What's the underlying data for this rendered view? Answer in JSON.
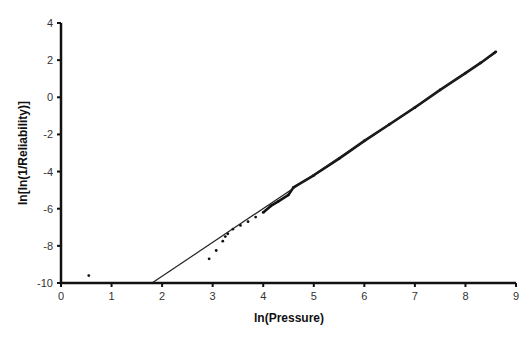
{
  "chart_data": {
    "type": "scatter",
    "title": "",
    "xlabel": "ln(Pressure)",
    "ylabel": "ln[ln(1/Reliability)]",
    "xlim": [
      0,
      9
    ],
    "ylim": [
      -10,
      4
    ],
    "xticks": [
      0,
      1,
      2,
      3,
      4,
      5,
      6,
      7,
      8,
      9
    ],
    "yticks": [
      4,
      2,
      0,
      -2,
      -4,
      -6,
      -8,
      -10
    ],
    "grid": false,
    "legend": null,
    "series": [
      {
        "name": "data points",
        "kind": "scatter",
        "points": [
          [
            0.55,
            -9.6
          ],
          [
            2.93,
            -8.7
          ],
          [
            3.07,
            -8.25
          ],
          [
            3.2,
            -7.75
          ],
          [
            3.25,
            -7.5
          ],
          [
            3.3,
            -7.35
          ],
          [
            3.4,
            -7.1
          ],
          [
            3.55,
            -6.9
          ],
          [
            3.7,
            -6.7
          ],
          [
            3.85,
            -6.45
          ],
          [
            4.0,
            -6.2
          ],
          [
            4.15,
            -5.85
          ],
          [
            4.3,
            -5.6
          ],
          [
            4.5,
            -5.25
          ],
          [
            4.6,
            -4.85
          ],
          [
            5.0,
            -4.2
          ],
          [
            5.5,
            -3.3
          ],
          [
            6.0,
            -2.35
          ],
          [
            6.5,
            -1.45
          ],
          [
            7.0,
            -0.55
          ],
          [
            7.5,
            0.4
          ],
          [
            8.0,
            1.3
          ],
          [
            8.3,
            1.85
          ],
          [
            8.6,
            2.45
          ]
        ]
      },
      {
        "name": "fitted line",
        "kind": "line",
        "points": [
          [
            1.8,
            -10.0
          ],
          [
            8.6,
            2.4
          ]
        ]
      }
    ]
  }
}
